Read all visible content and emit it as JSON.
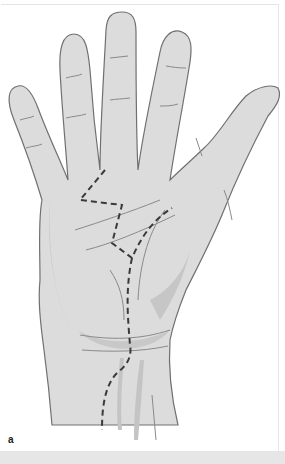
{
  "figure": {
    "panel_label": "a",
    "colors": {
      "skin": "#dcdcdc",
      "skin_shadow": "#bdbdbd",
      "outline": "#707070",
      "crease": "#8a8a8a",
      "incision": "#3a3a3a",
      "background": "#ffffff",
      "bottom_bar": "#e6e6e6"
    }
  }
}
